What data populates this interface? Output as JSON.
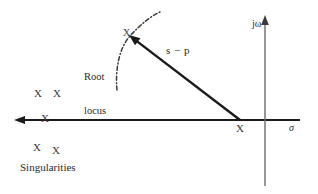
{
  "figure": {
    "background_color": "#ffffff",
    "ink_color": "#1a1a1a",
    "axis_gray": "#6b6b6b"
  },
  "axes": {
    "real_axis": {
      "label": "σ",
      "name": "sigma-axis",
      "y": 120,
      "x_start": 300,
      "x_end": 15,
      "arrow_direction": "left"
    },
    "imaginary_axis": {
      "label": "jω",
      "name": "j-omega-axis",
      "x": 265,
      "y_top": 16,
      "y_bottom": 186,
      "arrow_direction": "up"
    },
    "origin": {
      "x": 265,
      "y": 120
    }
  },
  "annotations": {
    "vector_label": "s − p",
    "root_locus_label_line1": "Root",
    "root_locus_label_line2": "locus",
    "singularities_label": "Singularities"
  },
  "vector": {
    "name": "s-minus-p-vector",
    "from": {
      "x": 240,
      "y": 120
    },
    "to": {
      "x": 130,
      "y": 36
    },
    "arrow_at": "to"
  },
  "root_locus_curve": {
    "style": "dash-dot",
    "points": "M117,90 C115,70 119,48 130,36 C141,24 151,16 160,12"
  },
  "poles": [
    {
      "id": "pole-a",
      "marker": "X",
      "x": 38,
      "y": 94,
      "region": "upper-left"
    },
    {
      "id": "pole-b",
      "marker": "X",
      "x": 57,
      "y": 94,
      "region": "upper-left"
    },
    {
      "id": "pole-c",
      "marker": "X",
      "x": 46,
      "y": 119,
      "region": "on-real-axis"
    },
    {
      "id": "pole-d",
      "marker": "X",
      "x": 37,
      "y": 148,
      "region": "lower-left"
    },
    {
      "id": "pole-e",
      "marker": "X",
      "x": 56,
      "y": 151,
      "region": "lower-left"
    },
    {
      "id": "pole-f",
      "marker": "X",
      "x": 240,
      "y": 129,
      "region": "real-axis-pole-p"
    },
    {
      "id": "pole-g",
      "marker": "X",
      "x": 128,
      "y": 34,
      "region": "on-root-locus-point-s"
    }
  ]
}
